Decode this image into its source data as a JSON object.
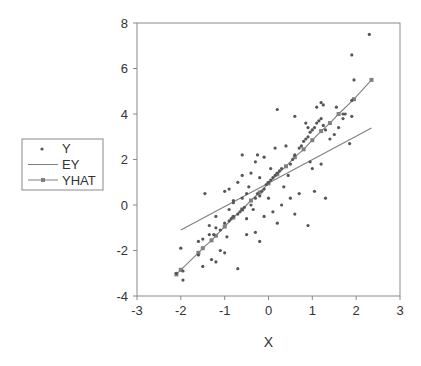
{
  "chart_data": {
    "type": "scatter",
    "title": "",
    "xlabel": "X",
    "ylabel": "",
    "xlim": [
      -3,
      3
    ],
    "ylim": [
      -4,
      8
    ],
    "xticks": [
      -3,
      -2,
      -1,
      0,
      1,
      2,
      3
    ],
    "yticks": [
      -4,
      -2,
      0,
      2,
      4,
      6,
      8
    ],
    "grid": false,
    "legend_position": "left",
    "legend": [
      "Y",
      "EY",
      "YHAT"
    ],
    "colors": {
      "Y": "#555555",
      "EY": "#808080",
      "YHAT": "#808080",
      "axis": "#808080"
    },
    "series": [
      {
        "name": "Y",
        "style": "points",
        "points": [
          [
            -2.1,
            -3.0
          ],
          [
            -1.95,
            -3.3
          ],
          [
            -1.95,
            -2.9
          ],
          [
            -2.0,
            -1.9
          ],
          [
            -1.5,
            -2.7
          ],
          [
            -1.3,
            -2.4
          ],
          [
            -1.2,
            -2.5
          ],
          [
            -1.6,
            -1.6
          ],
          [
            -1.5,
            -1.5
          ],
          [
            -1.35,
            -1.3
          ],
          [
            -1.25,
            -1.3
          ],
          [
            -1.2,
            -1.0
          ],
          [
            -1.1,
            -1.1
          ],
          [
            -1.0,
            -0.8
          ],
          [
            -0.9,
            -0.7
          ],
          [
            -0.85,
            -0.6
          ],
          [
            -0.8,
            -0.5
          ],
          [
            -0.7,
            -0.4
          ],
          [
            -0.65,
            -0.3
          ],
          [
            -0.6,
            -0.2
          ],
          [
            -0.55,
            -0.1
          ],
          [
            -1.35,
            -0.9
          ],
          [
            -1.1,
            -2.0
          ],
          [
            -1.0,
            -2.1
          ],
          [
            -0.95,
            -1.4
          ],
          [
            -1.45,
            0.5
          ],
          [
            -1.0,
            0.6
          ],
          [
            -0.9,
            0.7
          ],
          [
            -0.8,
            0.2
          ],
          [
            -0.7,
            1.0
          ],
          [
            -0.6,
            0.3
          ],
          [
            -0.5,
            0.5
          ],
          [
            -0.45,
            0.8
          ],
          [
            -0.4,
            0.0
          ],
          [
            -0.35,
            -0.2
          ],
          [
            -0.3,
            0.3
          ],
          [
            -0.25,
            0.5
          ],
          [
            -0.2,
            0.4
          ],
          [
            -0.15,
            0.6
          ],
          [
            -0.1,
            0.7
          ],
          [
            -0.05,
            0.9
          ],
          [
            0.0,
            1.0
          ],
          [
            0.05,
            1.1
          ],
          [
            0.1,
            1.2
          ],
          [
            0.15,
            1.3
          ],
          [
            0.2,
            1.4
          ],
          [
            0.25,
            1.5
          ],
          [
            0.3,
            1.6
          ],
          [
            -0.3,
            1.9
          ],
          [
            -0.1,
            2.1
          ],
          [
            0.15,
            2.5
          ],
          [
            0.4,
            2.6
          ],
          [
            -0.6,
            1.3
          ],
          [
            -0.4,
            1.4
          ],
          [
            -0.2,
            1.2
          ],
          [
            0.0,
            0.3
          ],
          [
            0.1,
            -0.3
          ],
          [
            -0.1,
            -0.5
          ],
          [
            -0.3,
            -1.2
          ],
          [
            -0.5,
            -1.3
          ],
          [
            -0.2,
            -1.6
          ],
          [
            -0.7,
            -2.8
          ],
          [
            -0.5,
            -0.6
          ],
          [
            0.2,
            4.2
          ],
          [
            -0.6,
            2.2
          ],
          [
            -0.8,
            0.1
          ],
          [
            0.35,
            0.8
          ],
          [
            0.5,
            0.3
          ],
          [
            0.6,
            -0.4
          ],
          [
            0.7,
            0.5
          ],
          [
            0.5,
            1.8
          ],
          [
            0.55,
            2.0
          ],
          [
            0.6,
            2.2
          ],
          [
            0.7,
            2.5
          ],
          [
            0.75,
            2.6
          ],
          [
            0.8,
            2.8
          ],
          [
            0.85,
            2.9
          ],
          [
            0.9,
            3.0
          ],
          [
            0.95,
            3.2
          ],
          [
            1.0,
            3.3
          ],
          [
            1.05,
            3.4
          ],
          [
            1.1,
            3.6
          ],
          [
            1.15,
            3.7
          ],
          [
            1.2,
            3.8
          ],
          [
            1.25,
            3.5
          ],
          [
            1.3,
            3.3
          ],
          [
            0.6,
            3.9
          ],
          [
            0.85,
            3.6
          ],
          [
            0.9,
            3.4
          ],
          [
            1.1,
            4.3
          ],
          [
            1.2,
            4.5
          ],
          [
            1.25,
            4.4
          ],
          [
            0.95,
            1.9
          ],
          [
            1.0,
            1.6
          ],
          [
            1.2,
            1.8
          ],
          [
            1.3,
            0.3
          ],
          [
            1.05,
            0.6
          ],
          [
            0.9,
            -0.9
          ],
          [
            1.4,
            2.9
          ],
          [
            1.6,
            3.4
          ],
          [
            1.7,
            3.8
          ],
          [
            1.75,
            4.0
          ],
          [
            1.55,
            4.3
          ],
          [
            1.85,
            2.7
          ],
          [
            1.9,
            4.6
          ],
          [
            1.95,
            5.5
          ],
          [
            1.9,
            6.6
          ],
          [
            2.3,
            7.5
          ],
          [
            1.9,
            3.9
          ],
          [
            1.7,
            4.0
          ],
          [
            1.5,
            3.1
          ],
          [
            0.3,
            0.0
          ],
          [
            0.2,
            -0.8
          ],
          [
            0.45,
            1.3
          ],
          [
            0.05,
            1.6
          ],
          [
            -0.25,
            2.2
          ],
          [
            -0.9,
            -0.2
          ],
          [
            -1.2,
            -0.5
          ],
          [
            -1.6,
            -2.2
          ]
        ]
      },
      {
        "name": "EY",
        "style": "line",
        "points": [
          [
            -2.0,
            -1.1
          ],
          [
            2.35,
            3.38
          ]
        ]
      },
      {
        "name": "YHAT",
        "style": "line-markers",
        "points": [
          [
            -2.1,
            -3.05
          ],
          [
            -2.0,
            -2.85
          ],
          [
            -1.6,
            -2.1
          ],
          [
            -1.5,
            -1.9
          ],
          [
            -1.3,
            -1.55
          ],
          [
            -1.2,
            -1.35
          ],
          [
            -1.0,
            -0.95
          ],
          [
            -0.8,
            -0.55
          ],
          [
            -0.6,
            -0.2
          ],
          [
            -0.4,
            0.2
          ],
          [
            -0.2,
            0.55
          ],
          [
            0.0,
            0.95
          ],
          [
            0.2,
            1.35
          ],
          [
            0.4,
            1.7
          ],
          [
            0.6,
            2.1
          ],
          [
            0.8,
            2.45
          ],
          [
            1.0,
            2.85
          ],
          [
            1.2,
            3.25
          ],
          [
            1.4,
            3.6
          ],
          [
            1.6,
            4.0
          ],
          [
            1.95,
            4.65
          ],
          [
            2.35,
            5.5
          ]
        ]
      }
    ]
  },
  "legend": {
    "items": [
      {
        "label": "Y"
      },
      {
        "label": "EY"
      },
      {
        "label": "YHAT"
      }
    ]
  },
  "axes": {
    "x_title": "X",
    "x_ticks": [
      "-3",
      "-2",
      "-1",
      "0",
      "1",
      "2",
      "3"
    ],
    "y_ticks": [
      "8",
      "6",
      "4",
      "2",
      "0",
      "-2",
      "-4"
    ]
  }
}
